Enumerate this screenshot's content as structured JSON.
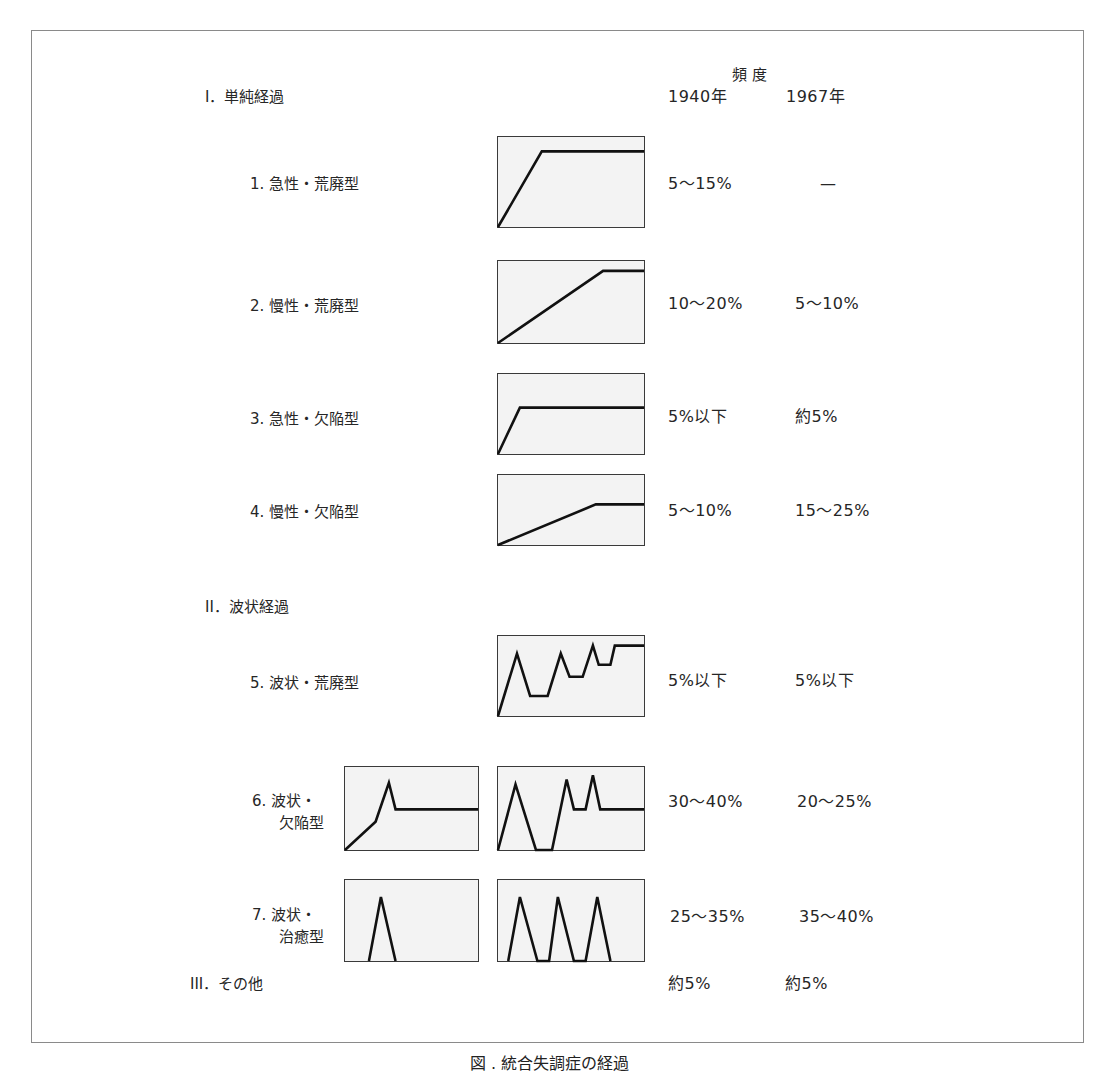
{
  "header": {
    "frequency_label": "頻 度",
    "year_1940": "1940年",
    "year_1967": "1967年"
  },
  "sections": [
    {
      "label": "I．単純経過"
    },
    {
      "label": "II．波状経過"
    },
    {
      "label": "III．その他",
      "freq_1940": "約5%",
      "freq_1967": "約5%"
    }
  ],
  "types": [
    {
      "num": "1.",
      "name": "急性・荒廃型",
      "freq_1940": "5～15%",
      "freq_1967": "—",
      "curve": "0,100 30,16 100,16"
    },
    {
      "num": "2.",
      "name": "慢性・荒廃型",
      "freq_1940": "10～20%",
      "freq_1967": "5～10%",
      "curve": "0,100 72,12 100,12"
    },
    {
      "num": "3.",
      "name": "急性・欠陥型",
      "freq_1940": "5%以下",
      "freq_1967": "約5%",
      "curve": "0,100 15,42 100,42"
    },
    {
      "num": "4.",
      "name": "慢性・欠陥型",
      "freq_1940": "5～10%",
      "freq_1967": "15～25%",
      "curve": "0,100 67,42 100,42"
    },
    {
      "num": "5.",
      "name": "波状・荒廃型",
      "freq_1940": "5%以下",
      "freq_1967": "5%以下",
      "curve": "0,100 13,22 22,75 34,75 43,22 49,51 58,51 65,12 69,36 77,36 80,12 100,12"
    },
    {
      "num": "6.",
      "name_line1": "波状・",
      "name_line2": "欠陥型",
      "freq_1940": "30～40%",
      "freq_1967": "20～25%",
      "curve_single": "0,100 23,66 33,19 38,51 100,51",
      "curve_multi": "0,100 12,21 26,100 37,100 47,15 52,51 60,51 65,10 70,51 100,51"
    },
    {
      "num": "7.",
      "name_line1": "波状・",
      "name_line2": "治癒型",
      "freq_1940": "25～35%",
      "freq_1967": "35～40%",
      "curve_single": "18,100 27,21 38,100",
      "curve_multi": "7,100 15,21 27,100 35,100 41,21 52,100 60,100 68,21 77,100"
    }
  ],
  "caption": "図 . 統合失調症の経過"
}
